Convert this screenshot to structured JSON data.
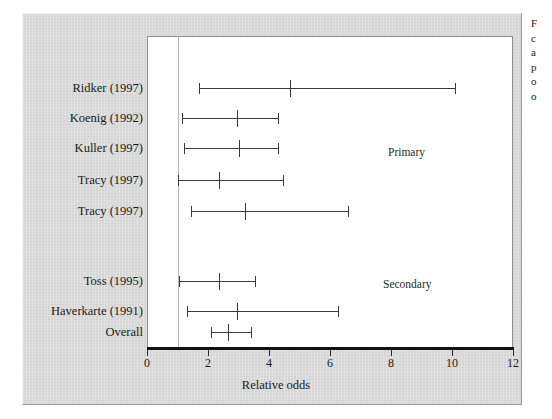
{
  "figure": {
    "background": "#ffffff",
    "panel_color": "#d9d9d9",
    "plot_background": "#ffffff",
    "axis_color": "#111111",
    "marker_color": "#3a3a3a",
    "refline_color": "#b7b7b7"
  },
  "axis": {
    "title": "Relative odds",
    "ticks": [
      {
        "value": 0,
        "label": "0"
      },
      {
        "value": 2,
        "label": "2"
      },
      {
        "value": 4,
        "label": "4"
      },
      {
        "value": 6,
        "label": "6"
      },
      {
        "value": 8,
        "label": "8"
      },
      {
        "value": 10,
        "label": "10"
      },
      {
        "value": 12,
        "label": "12"
      }
    ],
    "min": 0,
    "max": 12,
    "reference_value": 1
  },
  "legend": {
    "items": [
      {
        "marker": "interval-bar-icon",
        "label": "97.5% CI/2.5% CI"
      },
      {
        "marker": "mean-interval-icon",
        "label": "Mean"
      }
    ]
  },
  "groups": [
    {
      "name": "Primary",
      "label": "Primary"
    },
    {
      "name": "Secondary",
      "label": "Secondary"
    }
  ],
  "caption": {
    "lines": [
      "F",
      "c",
      "a",
      "p",
      "o",
      "o"
    ]
  },
  "chart_data": {
    "type": "forest",
    "title": "",
    "xlabel": "Relative odds",
    "ylabel": "",
    "xlim": [
      0,
      12
    ],
    "grid": false,
    "legend_position": "top-right",
    "reference_line": 1,
    "studies": [
      {
        "label": "Ridker (1997)",
        "group": "Primary",
        "mean": 4.7,
        "ci_low": 1.7,
        "ci_high": 10.1
      },
      {
        "label": "Koenig (1992)",
        "group": "Primary",
        "mean": 2.95,
        "ci_low": 1.15,
        "ci_high": 4.3
      },
      {
        "label": "Kuller (1997)",
        "group": "Primary",
        "mean": 3.0,
        "ci_low": 1.2,
        "ci_high": 4.3
      },
      {
        "label": "Tracy (1997)",
        "group": "Primary",
        "mean": 2.35,
        "ci_low": 1.0,
        "ci_high": 4.45
      },
      {
        "label": "Tracy (1997)",
        "group": "Primary",
        "mean": 3.2,
        "ci_low": 1.45,
        "ci_high": 6.6
      },
      {
        "label": "Toss (1995)",
        "group": "Secondary",
        "mean": 2.35,
        "ci_low": 1.05,
        "ci_high": 3.55
      },
      {
        "label": "Haverkarte (1991)",
        "group": "Secondary",
        "mean": 2.95,
        "ci_low": 1.3,
        "ci_high": 6.25
      },
      {
        "label": "Overall",
        "group": "",
        "mean": 2.65,
        "ci_low": 2.1,
        "ci_high": 3.4
      }
    ]
  }
}
